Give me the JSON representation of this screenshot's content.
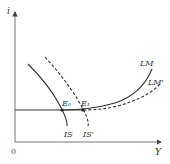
{
  "diagram": {
    "type": "IS-LM",
    "axes": {
      "y_label": "i",
      "x_label": "Y",
      "origin_label": "0"
    },
    "curves": [
      {
        "id": "IS",
        "label": "IS",
        "style": "solid"
      },
      {
        "id": "IS_prime",
        "label": "IS'",
        "style": "dashed"
      },
      {
        "id": "LM",
        "label": "LM",
        "style": "solid"
      },
      {
        "id": "LM_prime",
        "label": "LM'",
        "style": "dashed"
      }
    ],
    "points": [
      {
        "id": "E0",
        "label": "E₀"
      },
      {
        "id": "E1",
        "label": "E₁"
      }
    ],
    "colors": {
      "line": "#333333",
      "axis": "#555555",
      "background": "#ffffff"
    }
  }
}
